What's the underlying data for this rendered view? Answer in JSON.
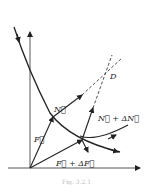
{
  "diagram": {
    "labels": {
      "F": "F⃗",
      "N": "N⃗",
      "N_plus_dN": "N⃗ + ΔN⃗",
      "F_plus_dF": "F⃗ + ΔF⃗",
      "D": "D"
    },
    "caption": "Fig. 3.2.1",
    "colors": {
      "ink": "#222222",
      "background": "#ffffff"
    }
  }
}
